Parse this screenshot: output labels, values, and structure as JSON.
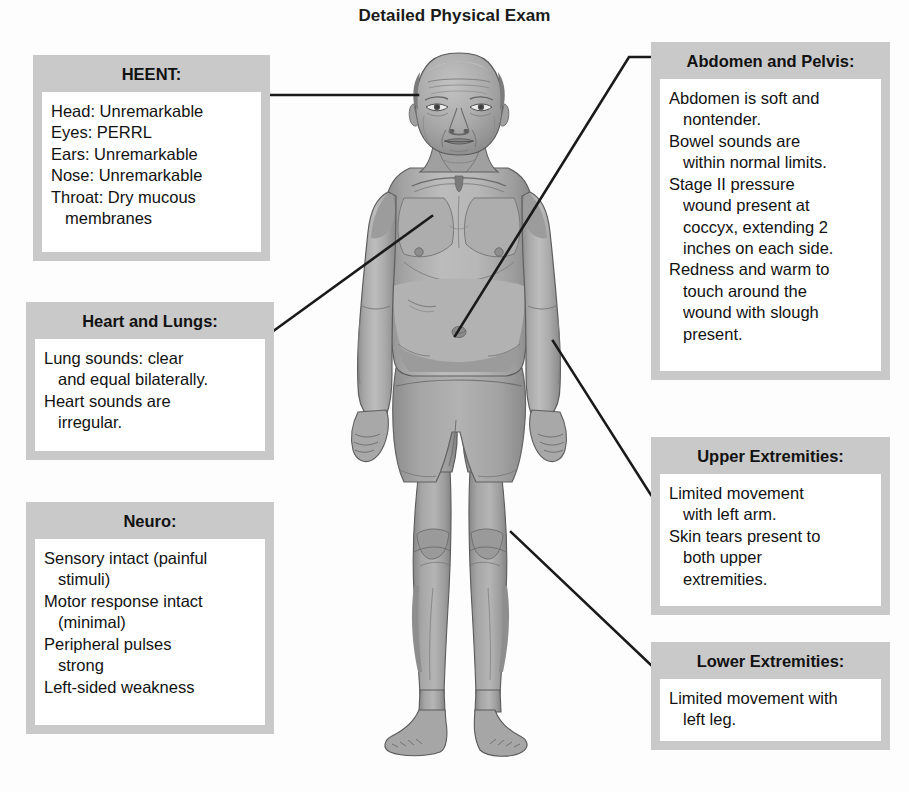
{
  "title": "Detailed Physical Exam",
  "figure": {
    "name": "elderly-male-anterior-body-illustration"
  },
  "colors": {
    "background": "#fdfdfd",
    "callout_frame": "#c9c9c9",
    "callout_body": "#ffffff",
    "text": "#121212",
    "leader_line": "#1a1a1a",
    "skin_light": "#b4b4b4",
    "skin_mid": "#9a9a9a",
    "skin_shadow": "#7d7d7d",
    "shorts": "#a9a9a9",
    "outline": "#545454"
  },
  "callouts": [
    {
      "id": "heent",
      "title": "HEENT:",
      "lines": [
        {
          "text": "Head: Unremarkable",
          "continuation": false
        },
        {
          "text": "Eyes: PERRL",
          "continuation": false
        },
        {
          "text": "Ears: Unremarkable",
          "continuation": false
        },
        {
          "text": "Nose: Unremarkable",
          "continuation": false
        },
        {
          "text": "Throat: Dry mucous",
          "continuation": false
        },
        {
          "text": "membranes",
          "continuation": true
        }
      ]
    },
    {
      "id": "heart-lungs",
      "title": "Heart and Lungs:",
      "lines": [
        {
          "text": "Lung sounds: clear",
          "continuation": false
        },
        {
          "text": "and equal bilaterally.",
          "continuation": true
        },
        {
          "text": "Heart sounds are",
          "continuation": false
        },
        {
          "text": "irregular.",
          "continuation": true
        }
      ]
    },
    {
      "id": "neuro",
      "title": "Neuro:",
      "lines": [
        {
          "text": "Sensory intact (painful",
          "continuation": false
        },
        {
          "text": "stimuli)",
          "continuation": true
        },
        {
          "text": "Motor response intact",
          "continuation": false
        },
        {
          "text": "(minimal)",
          "continuation": true
        },
        {
          "text": "Peripheral pulses",
          "continuation": false
        },
        {
          "text": "strong",
          "continuation": true
        },
        {
          "text": "Left-sided weakness",
          "continuation": false
        }
      ]
    },
    {
      "id": "abdomen-pelvis",
      "title": "Abdomen and Pelvis:",
      "lines": [
        {
          "text": "Abdomen is soft and",
          "continuation": false
        },
        {
          "text": "nontender.",
          "continuation": true
        },
        {
          "text": "Bowel sounds are",
          "continuation": false
        },
        {
          "text": "within normal limits.",
          "continuation": true
        },
        {
          "text": "Stage II pressure",
          "continuation": false
        },
        {
          "text": "wound present at",
          "continuation": true
        },
        {
          "text": "coccyx, extending 2",
          "continuation": true
        },
        {
          "text": "inches on each side.",
          "continuation": true
        },
        {
          "text": "Redness and warm to",
          "continuation": false
        },
        {
          "text": "touch around the",
          "continuation": true
        },
        {
          "text": "wound with slough",
          "continuation": true
        },
        {
          "text": "present.",
          "continuation": true
        }
      ]
    },
    {
      "id": "upper-extremities",
      "title": "Upper Extremities:",
      "lines": [
        {
          "text": "Limited movement",
          "continuation": false
        },
        {
          "text": "with left arm.",
          "continuation": true
        },
        {
          "text": "Skin tears present to",
          "continuation": false
        },
        {
          "text": "both upper",
          "continuation": true
        },
        {
          "text": "extremities.",
          "continuation": true
        }
      ]
    },
    {
      "id": "lower-extremities",
      "title": "Lower Extremities:",
      "lines": [
        {
          "text": "Limited movement with",
          "continuation": false
        },
        {
          "text": "left leg.",
          "continuation": true
        }
      ]
    }
  ],
  "leader_lines": [
    {
      "id": "heent-leader",
      "target": "head",
      "points": "268,95 418,95"
    },
    {
      "id": "heart-lungs-leader",
      "target": "chest",
      "points": "272,332 432,216"
    },
    {
      "id": "abdomen-pelvis-leader",
      "target": "abdomen",
      "points": "651,57 629,57 455,336"
    },
    {
      "id": "upper-extremities-leader",
      "target": "arm",
      "points": "651,495 553,341"
    },
    {
      "id": "lower-extremities-leader",
      "target": "leg",
      "points": "651,665 511,532"
    }
  ]
}
